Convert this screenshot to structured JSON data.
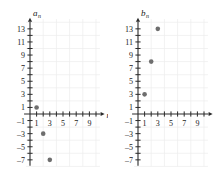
{
  "figure": {
    "background": "#ffffff",
    "point_color": "#6e6e6e",
    "axis_color": "#2b2b2b",
    "grid_color": "#ededed"
  },
  "chart_data": [
    {
      "type": "scatter",
      "title": "",
      "ylabel": "a",
      "ylabel_sub": "n",
      "xlabel": "n",
      "x": [
        1,
        2,
        3
      ],
      "values": [
        1,
        -3,
        -7
      ],
      "points": [
        {
          "x": 1,
          "y": 1
        },
        {
          "x": 2,
          "y": -3
        },
        {
          "x": 3,
          "y": -7
        }
      ],
      "xlim": [
        -1,
        10.5
      ],
      "ylim": [
        -8,
        14.5
      ],
      "xticks": [
        1,
        2,
        3,
        4,
        5,
        6,
        7,
        8,
        9,
        10
      ],
      "xtick_labels": [
        "1",
        "",
        "3",
        "",
        "5",
        "",
        "7",
        "",
        "9",
        ""
      ],
      "yticks": [
        13,
        12,
        11,
        10,
        9,
        8,
        7,
        6,
        5,
        4,
        3,
        2,
        1,
        -1,
        -2,
        -3,
        -4,
        -5,
        -6,
        -7
      ],
      "ytick_labels": [
        "13",
        "",
        "11",
        "",
        "9",
        "",
        "7",
        "",
        "5",
        "",
        "3",
        "",
        "1",
        "–1",
        "",
        "–3",
        "",
        "–5",
        "",
        "–7"
      ],
      "grid": true,
      "grid_step": 2,
      "legend": "none"
    },
    {
      "type": "scatter",
      "title": "",
      "ylabel": "b",
      "ylabel_sub": "n",
      "xlabel": "",
      "x": [
        1,
        2,
        3
      ],
      "values": [
        3,
        8,
        13
      ],
      "points": [
        {
          "x": 1,
          "y": 3
        },
        {
          "x": 2,
          "y": 8
        },
        {
          "x": 3,
          "y": 13
        }
      ],
      "xlim": [
        -1,
        10.5
      ],
      "ylim": [
        -8,
        14.5
      ],
      "xticks": [
        1,
        2,
        3,
        4,
        5,
        6,
        7,
        8,
        9,
        10
      ],
      "xtick_labels": [
        "1",
        "",
        "3",
        "",
        "5",
        "",
        "7",
        "",
        "9",
        ""
      ],
      "yticks": [
        13,
        12,
        11,
        10,
        9,
        8,
        7,
        6,
        5,
        4,
        3,
        2,
        1,
        -1,
        -2,
        -3,
        -4,
        -5,
        -6,
        -7
      ],
      "ytick_labels": [
        "13",
        "",
        "11",
        "",
        "9",
        "",
        "7",
        "",
        "5",
        "",
        "3",
        "",
        "1",
        "–1",
        "",
        "–3",
        "",
        "–5",
        "",
        "–7"
      ],
      "grid": true,
      "grid_step": 2,
      "legend": "none"
    }
  ]
}
